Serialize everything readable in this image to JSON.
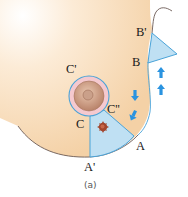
{
  "figure": {
    "caption": "(a)",
    "labels": {
      "B_prime": "B'",
      "B": "B",
      "C_prime": "C'",
      "C": "C",
      "C_double_prime": "C''",
      "A": "A",
      "A_prime": "A'"
    },
    "colors": {
      "skin_light": "#fffaf3",
      "skin": "#f6d9b4",
      "outline": "#6b5a55",
      "flap_fill": "#bfe0f3",
      "flap_stroke": "#4aa3d8",
      "arrow": "#2a93e0",
      "areola_outer": "#f5c9cf",
      "nipple": "#c9977a",
      "tumor": "#a2462e"
    },
    "icons": [
      "down-arrow-icon",
      "down-arrow-icon",
      "up-arrow-icon",
      "up-arrow-icon",
      "tumor-icon"
    ]
  }
}
